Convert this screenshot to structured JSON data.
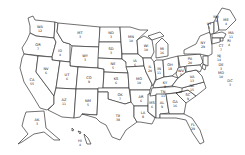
{
  "map": {
    "type": "us-states-outline",
    "states": [
      {
        "abbr": "WA",
        "ev": "12",
        "x": 40,
        "y": 28,
        "path": "M28,18 L33,16 L35,20 L55,22 L54,38 L36,36 L30,33 L30,26 Z"
      },
      {
        "abbr": "OR",
        "ev": "7",
        "x": 38,
        "y": 46,
        "path": "M30,33 L36,36 L54,38 L56,42 L52,57 L24,54 L22,48 L27,40 Z"
      },
      {
        "abbr": "CA",
        "ev": "55",
        "x": 32,
        "y": 81,
        "path": "M24,54 L38,56 L36,72 L54,96 L54,104 L47,110 L40,108 L34,98 L24,82 L20,68 L22,58 Z"
      },
      {
        "abbr": "ID",
        "ev": "4",
        "x": 60,
        "y": 52,
        "path": "M55,22 L58,23 L57,32 L63,42 L70,44 L70,62 L52,60 L52,57 L56,42 L54,38 Z"
      },
      {
        "abbr": "NV",
        "ev": "6",
        "x": 46,
        "y": 70,
        "path": "M38,56 L52,57 L52,60 L60,61 L56,88 L54,96 L36,72 Z"
      },
      {
        "abbr": "MT",
        "ev": "3",
        "x": 80,
        "y": 34,
        "path": "M58,23 L100,27 L99,47 L72,46 L70,44 L63,42 L57,32 Z"
      },
      {
        "abbr": "WY",
        "ev": "3",
        "x": 85,
        "y": 57,
        "path": "M72,46 L99,47 L98,68 L70,66 L70,62 Z"
      },
      {
        "abbr": "UT",
        "ev": "6",
        "x": 67,
        "y": 76,
        "path": "M60,61 L70,62 L70,66 L78,67 L76,89 L56,88 Z"
      },
      {
        "abbr": "CO",
        "ev": "9",
        "x": 89,
        "y": 79,
        "path": "M78,67 L98,68 L104,69 L103,89 L76,89 Z"
      },
      {
        "abbr": "AZ",
        "ev": "11",
        "x": 64,
        "y": 101,
        "path": "M56,88 L76,89 L74,118 L62,117 L48,110 L54,104 L54,96 Z"
      },
      {
        "abbr": "NM",
        "ev": "5",
        "x": 88,
        "y": 102,
        "path": "M76,89 L98,89 L97,115 L82,114 L80,117 L74,118 Z"
      },
      {
        "abbr": "ND",
        "ev": "3",
        "x": 111,
        "y": 34,
        "path": "M100,27 L120,27 L121,42 L99,42 Z"
      },
      {
        "abbr": "SD",
        "ev": "3",
        "x": 111,
        "y": 50,
        "path": "M99,42 L121,42 L122,59 L98,58 Z"
      },
      {
        "abbr": "NE",
        "ev": "5",
        "x": 113,
        "y": 65,
        "path": "M98,58 L122,59 L126,62 L128,73 L104,72 L104,69 L98,68 Z"
      },
      {
        "abbr": "KS",
        "ev": "6",
        "x": 116,
        "y": 80,
        "path": "M104,72 L128,73 L129,88 L103,88 Z"
      },
      {
        "abbr": "OK",
        "ev": "7",
        "x": 120,
        "y": 96,
        "path": "M98,88 L129,88 L131,102 L125,104 L114,101 L108,99 L108,92 L98,92 Z"
      },
      {
        "abbr": "TX",
        "ev": "38",
        "x": 118,
        "y": 117,
        "path": "M98,92 L108,92 L108,99 L125,104 L131,102 L134,104 L134,117 L137,122 L126,130 L120,140 L112,137 L106,125 L100,122 L96,118 L82,114 L97,115 Z"
      },
      {
        "abbr": "MN",
        "ev": "10",
        "x": 131,
        "y": 38,
        "path": "M120,27 L130,27 L140,30 L148,30 L137,40 L138,54 L122,54 L121,42 Z"
      },
      {
        "abbr": "IA",
        "ev": "6",
        "x": 135,
        "y": 62,
        "path": "M122,54 L138,54 L143,58 L144,66 L126,67 L126,62 L122,59 Z"
      },
      {
        "abbr": "MO",
        "ev": "10",
        "x": 139,
        "y": 80,
        "path": "M126,67 L144,66 L146,72 L152,84 L150,90 L130,90 L129,88 L128,73 Z"
      },
      {
        "abbr": "AR",
        "ev": "6",
        "x": 141,
        "y": 98,
        "path": "M130,90 L150,90 L148,106 L134,106 L131,102 Z"
      },
      {
        "abbr": "LA",
        "ev": "8",
        "x": 143,
        "y": 114,
        "path": "M134,106 L148,106 L148,112 L155,118 L152,124 L140,122 L137,122 L134,117 Z"
      },
      {
        "abbr": "WI",
        "ev": "10",
        "x": 146,
        "y": 47,
        "path": "M137,40 L144,36 L152,40 L154,52 L151,58 L143,58 L138,54 Z"
      },
      {
        "abbr": "IL",
        "ev": "20",
        "x": 150,
        "y": 68,
        "path": "M143,58 L151,58 L154,62 L156,78 L153,86 L152,84 L146,72 L144,66 Z"
      },
      {
        "abbr": "MS",
        "ev": "6",
        "x": 152,
        "y": 104,
        "path": "M148,94 L156,94 L156,118 L148,112 L148,106 Z"
      },
      {
        "abbr": "MI",
        "ev": "16",
        "x": 162,
        "y": 50,
        "path": "M156,44 L162,38 L168,44 L168,56 L156,58 Z M148,36 L160,32 L164,36 L152,40 Z"
      },
      {
        "abbr": "IN",
        "ev": "11",
        "x": 159,
        "y": 70,
        "path": "M156,60 L163,60 L164,77 L156,80 L156,78 L154,62 Z"
      },
      {
        "abbr": "OH",
        "ev": "18",
        "x": 170,
        "y": 66,
        "path": "M163,60 L170,58 L178,56 L179,70 L172,76 L164,77 Z"
      },
      {
        "abbr": "KY",
        "ev": "8",
        "x": 165,
        "y": 84,
        "path": "M153,86 L156,80 L164,77 L172,76 L178,78 L172,86 L154,88 Z"
      },
      {
        "abbr": "TN",
        "ev": "11",
        "x": 163,
        "y": 93,
        "path": "M152,88 L184,86 L182,92 L150,96 Z"
      },
      {
        "abbr": "AL",
        "ev": "9",
        "x": 162,
        "y": 104,
        "path": "M156,94 L166,94 L169,113 L160,114 L160,118 L156,118 Z"
      },
      {
        "abbr": "GA",
        "ev": "16",
        "x": 175,
        "y": 103,
        "path": "M166,94 L176,93 L186,103 L184,114 L170,114 L169,113 Z"
      },
      {
        "abbr": "FL",
        "ev": "29",
        "x": 193,
        "y": 126,
        "path": "M160,114 L184,114 L192,118 L200,130 L204,142 L200,144 L192,132 L186,120 L176,118 L160,118 Z"
      },
      {
        "abbr": "SC",
        "ev": "9",
        "x": 188,
        "y": 96,
        "path": "M176,93 L188,90 L196,96 L186,103 Z"
      },
      {
        "abbr": "NC",
        "ev": "15",
        "x": 192,
        "y": 87,
        "path": "M182,88 L204,82 L206,88 L196,96 L188,90 L176,93 L182,92 Z"
      },
      {
        "abbr": "VA",
        "ev": "13",
        "x": 192,
        "y": 78,
        "path": "M178,78 L186,72 L196,70 L202,76 L204,82 L182,88 L172,86 Z"
      },
      {
        "abbr": "WV",
        "ev": "5",
        "x": 181,
        "y": 72,
        "path": "M178,68 L184,66 L186,72 L178,78 L176,74 Z"
      },
      {
        "abbr": "PA",
        "ev": "20",
        "x": 190,
        "y": 60,
        "path": "M178,56 L200,54 L203,62 L200,65 L180,67 Z"
      },
      {
        "abbr": "NY",
        "ev": "29",
        "x": 203,
        "y": 44,
        "path": "M184,50 L196,44 L200,36 L210,32 L212,46 L212,54 L208,56 L200,54 L184,54 Z"
      },
      {
        "abbr": "VT",
        "ev": "3",
        "x": 209,
        "y": 25,
        "path": "M208,24 L214,22 L214,34 L210,34 Z"
      },
      {
        "abbr": "NH",
        "ev": "4",
        "x": 216,
        "y": 18,
        "path": "M214,22 L217,16 L219,30 L214,34 Z"
      },
      {
        "abbr": "ME",
        "ev": "4",
        "x": 226,
        "y": 21,
        "path": "M217,16 L222,8 L230,10 L236,20 L226,30 L219,30 Z"
      },
      {
        "abbr": "MA",
        "ev": "11",
        "x": 231,
        "y": 34,
        "path": "M212,34 L222,32 L226,34 L224,38 L212,38 Z"
      },
      {
        "abbr": "RI",
        "ev": "4",
        "x": 229,
        "y": 42,
        "path": "M220,38 L223,38 L223,41 L220,41 Z"
      },
      {
        "abbr": "CT",
        "ev": "7",
        "x": 221,
        "y": 47,
        "path": "M212,38 L220,38 L220,42 L212,44 Z"
      },
      {
        "abbr": "NJ",
        "ev": "14",
        "x": 219,
        "y": 57,
        "path": "M203,56 L208,56 L208,66 L203,64 Z"
      },
      {
        "abbr": "DE",
        "ev": "3",
        "x": 221,
        "y": 66,
        "path": "M203,64 L206,66 L205,70 L202,68 Z"
      },
      {
        "abbr": "MD",
        "ev": "10",
        "x": 221,
        "y": 74,
        "path": "M186,66 L200,65 L202,68 L200,72 L196,70 L186,72 Z"
      },
      {
        "abbr": "DC",
        "ev": "3",
        "x": 230,
        "y": 82,
        "path": ""
      },
      {
        "abbr": "AK",
        "ev": "3",
        "x": 37,
        "y": 121,
        "path": "M26,112 L44,111 L46,128 L60,140 L54,140 L44,132 L34,134 L22,142 L18,144 L28,134 L22,126 L24,118 Z"
      },
      {
        "abbr": "HI",
        "ev": "4",
        "x": 80,
        "y": 142,
        "path": "M72,128 L74,130 L72,131 Z M78,131 L81,132 L80,134 Z M84,134 L88,138 L91,144 L87,144 L85,138 Z"
      }
    ]
  }
}
